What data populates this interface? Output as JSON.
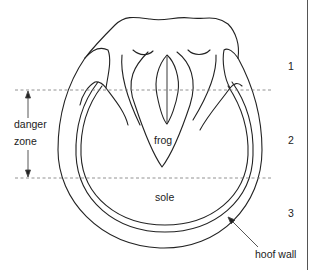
{
  "figure": {
    "labels": {
      "frog": "frog",
      "sole": "sole",
      "hoof_wall": "hoof wall",
      "danger_line1": "danger",
      "danger_line2": "zone"
    },
    "zones": [
      {
        "number": "1"
      },
      {
        "number": "2"
      },
      {
        "number": "3"
      }
    ],
    "colors": {
      "line": "#222222",
      "dashed": "#777777",
      "background": "#ffffff"
    }
  }
}
